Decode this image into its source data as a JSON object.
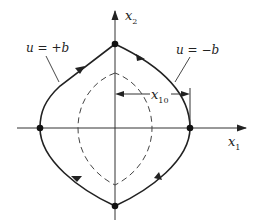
{
  "diagram": {
    "type": "phase-plane",
    "axes": {
      "horizontal": {
        "label": "x",
        "subscript": "1"
      },
      "vertical": {
        "label": "x",
        "subscript": "2"
      }
    },
    "annotations": {
      "plus_b": "u = +b",
      "minus_b": "u = −b",
      "x10": {
        "label": "x",
        "subscript": "10"
      }
    },
    "curves": [
      {
        "name": "switching-trajectory",
        "style": "solid",
        "direction": "clockwise",
        "through": [
          "top",
          "right",
          "bottom",
          "left"
        ]
      },
      {
        "name": "inner-trajectory",
        "style": "dashed"
      }
    ],
    "points": [
      "top",
      "right",
      "bottom",
      "left"
    ],
    "colors": {
      "ink": "#222222",
      "background": "#ffffff"
    }
  }
}
